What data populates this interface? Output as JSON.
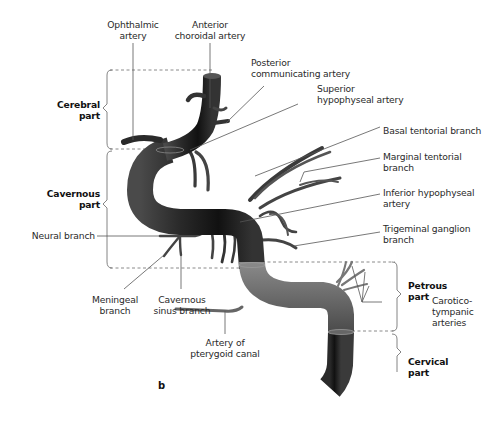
{
  "figure": {
    "panel_letter": "b",
    "colors": {
      "artery_dark": "#1e1e1e",
      "artery_mid": "#5a5a5a",
      "artery_light": "#9a9a9a",
      "leader_line": "#555555",
      "dashed_line": "#888888",
      "text": "#2a2a2a"
    }
  },
  "segments": [
    {
      "id": "cerebral",
      "line1": "Cerebral",
      "line2": "part"
    },
    {
      "id": "cavernous",
      "line1": "Cavernous",
      "line2": "part"
    },
    {
      "id": "petrous",
      "line1": "Petrous",
      "line2": "part"
    },
    {
      "id": "cervical",
      "line1": "Cervical",
      "line2": "part"
    }
  ],
  "labels": {
    "ophthalmic": {
      "line1": "Ophthalmic",
      "line2": "artery"
    },
    "anterior_choroidal": {
      "line1": "Anterior",
      "line2": "choroidal artery"
    },
    "posterior_communicating": {
      "line1": "Posterior",
      "line2": "communicating artery"
    },
    "superior_hypophyseal": {
      "line1": "Superior",
      "line2": "hypophyseal artery"
    },
    "basal_tentorial": {
      "line1": "Basal tentorial branch"
    },
    "marginal_tentorial": {
      "line1": "Marginal tentorial",
      "line2": "branch"
    },
    "inferior_hypophyseal": {
      "line1": "Inferior hypophyseal",
      "line2": "artery"
    },
    "trigeminal_ganglion": {
      "line1": "Trigeminal ganglion",
      "line2": "branch"
    },
    "neural_branch": {
      "line1": "Neural branch"
    },
    "meningeal": {
      "line1": "Meningeal",
      "line2": "branch"
    },
    "cavernous_sinus": {
      "line1": "Cavernous",
      "line2": "sinus branch"
    },
    "pterygoid_canal": {
      "line1": "Artery of",
      "line2": "pterygoid canal"
    },
    "caroticotympanic": {
      "line1": "Carotico-",
      "line2": "tympanic",
      "line3": "arteries"
    }
  }
}
